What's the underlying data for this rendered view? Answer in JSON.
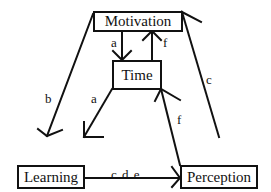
{
  "diagram": {
    "nodes": {
      "motivation": "Motivation",
      "time": "Time",
      "learning": "Learning",
      "perception": "Perception"
    },
    "edges": [
      {
        "from": "Motivation",
        "to": "Time",
        "label": "a"
      },
      {
        "from": "Time",
        "to": "Motivation",
        "label": "f"
      },
      {
        "from": "Motivation",
        "to": "Learning",
        "label": "b"
      },
      {
        "from": "Time",
        "to": "Learning",
        "label": "a"
      },
      {
        "from": "Perception",
        "to": "Time",
        "label": "f"
      },
      {
        "from": "Perception",
        "to": "Motivation",
        "label": "c"
      },
      {
        "from": "Learning",
        "to": "Perception",
        "label": "c d e"
      }
    ],
    "labels": {
      "mot_time": "a",
      "time_mot": "f",
      "mot_learn": "b",
      "time_learn": "a",
      "perc_time": "f",
      "perc_mot": "c",
      "learn_perc": "c d e"
    },
    "colors": {
      "line": "#111111",
      "background": "#ffffff"
    }
  }
}
